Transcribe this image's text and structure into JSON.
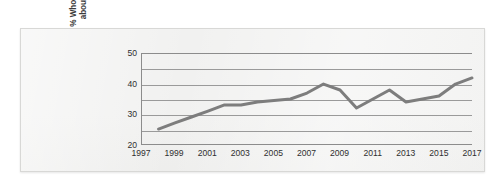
{
  "chart_data": {
    "type": "line",
    "title": "",
    "subtitle": "",
    "xlabel": "",
    "ylabel_lines": [
      "% Who worry a great deal",
      "about global warming"
    ],
    "ylabel": "% Who worry a great deal about global warming",
    "ylim": [
      20,
      50
    ],
    "xlim": [
      1997,
      2017
    ],
    "grid": true,
    "legend": "none",
    "y_ticks": [
      50,
      40,
      30,
      20
    ],
    "y_tick_labels": [
      "50",
      "40",
      "30",
      "20"
    ],
    "y_gridlines": [
      50,
      45,
      40,
      35,
      30,
      25,
      20
    ],
    "x_ticks": [
      1997,
      1999,
      2001,
      2003,
      2005,
      2007,
      2009,
      2011,
      2013,
      2015,
      2017
    ],
    "x_tick_labels": [
      "1997",
      "1999",
      "2001",
      "2003",
      "2005",
      "2007",
      "2009",
      "2011",
      "2013",
      "2015",
      "2017"
    ],
    "series": [
      {
        "name": "% Who worry a great deal about global warming",
        "color": "#7d7d7d",
        "x": [
          1998,
          1999,
          2000,
          2001,
          2002,
          2003,
          2004,
          2005,
          2006,
          2007,
          2008,
          2009,
          2010,
          2011,
          2012,
          2013,
          2014,
          2015,
          2016,
          2017
        ],
        "values": [
          25,
          27,
          29,
          31,
          33,
          33,
          34,
          34.5,
          35,
          37,
          40,
          38,
          32,
          35,
          38,
          34,
          35,
          36,
          40,
          42
        ]
      }
    ]
  },
  "style": {
    "line_color": "#7d7d7d",
    "axis_color": "#8c8c8c",
    "grid_color": "#9a9a9a",
    "text_color": "#2f2f2f",
    "panel_background": "#f1f1f0",
    "page_background": "#ffffff"
  }
}
